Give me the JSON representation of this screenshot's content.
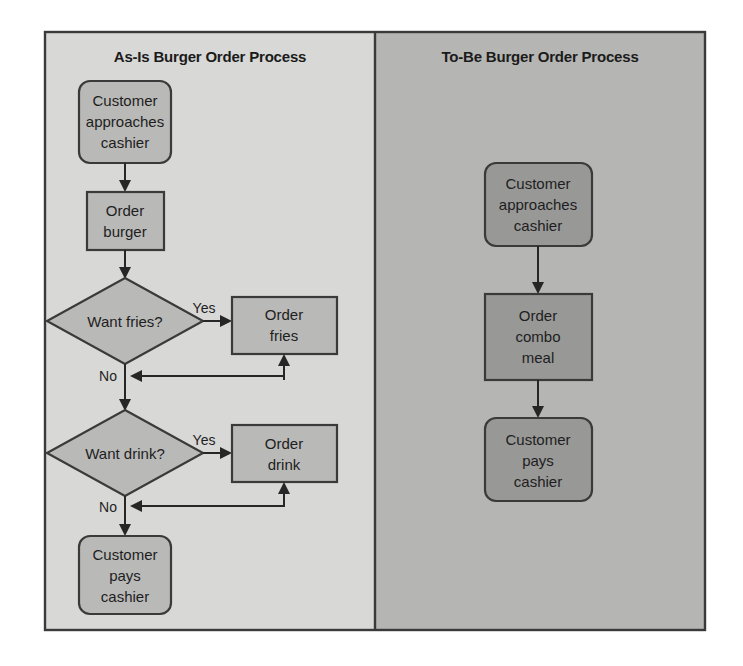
{
  "figure": {
    "background_color": "#ffffff",
    "frame_border_color": "#3a3a3a"
  },
  "panels": [
    {
      "id": "as-is",
      "title": "As-Is Burger Order Process",
      "background_color": "#d8d8d6",
      "node_fill": "#b9b9b7",
      "nodes": [
        {
          "id": "as-start",
          "type": "terminator",
          "label_lines": [
            "Customer",
            "approaches",
            "cashier"
          ]
        },
        {
          "id": "as-burger",
          "type": "process",
          "label_lines": [
            "Order",
            "burger"
          ]
        },
        {
          "id": "as-fries-q",
          "type": "decision",
          "label_lines": [
            "Want fries?"
          ]
        },
        {
          "id": "as-fries",
          "type": "process",
          "label_lines": [
            "Order",
            "fries"
          ]
        },
        {
          "id": "as-drink-q",
          "type": "decision",
          "label_lines": [
            "Want drink?"
          ]
        },
        {
          "id": "as-drink",
          "type": "process",
          "label_lines": [
            "Order",
            "drink"
          ]
        },
        {
          "id": "as-pays",
          "type": "terminator",
          "label_lines": [
            "Customer",
            "pays",
            "cashier"
          ]
        }
      ],
      "edge_labels": [
        {
          "id": "fries-yes",
          "text": "Yes"
        },
        {
          "id": "fries-no",
          "text": "No"
        },
        {
          "id": "drink-yes",
          "text": "Yes"
        },
        {
          "id": "drink-no",
          "text": "No"
        }
      ]
    },
    {
      "id": "to-be",
      "title": "To-Be Burger Order Process",
      "background_color": "#b5b5b3",
      "node_fill": "#989897",
      "nodes": [
        {
          "id": "tb-start",
          "type": "terminator",
          "label_lines": [
            "Customer",
            "approaches",
            "cashier"
          ]
        },
        {
          "id": "tb-combo",
          "type": "process",
          "label_lines": [
            "Order",
            "combo",
            "meal"
          ]
        },
        {
          "id": "tb-pays",
          "type": "terminator",
          "label_lines": [
            "Customer",
            "pays",
            "cashier"
          ]
        }
      ],
      "edge_labels": []
    }
  ],
  "text": {
    "as_is_title": "As-Is Burger Order Process",
    "to_be_title": "To-Be Burger Order Process",
    "as_start_l1": "Customer",
    "as_start_l2": "approaches",
    "as_start_l3": "cashier",
    "as_burger_l1": "Order",
    "as_burger_l2": "burger",
    "as_fries_q": "Want fries?",
    "as_fries_l1": "Order",
    "as_fries_l2": "fries",
    "as_drink_q": "Want drink?",
    "as_drink_l1": "Order",
    "as_drink_l2": "drink",
    "as_pays_l1": "Customer",
    "as_pays_l2": "pays",
    "as_pays_l3": "cashier",
    "yes_fries": "Yes",
    "no_fries": "No",
    "yes_drink": "Yes",
    "no_drink": "No",
    "tb_start_l1": "Customer",
    "tb_start_l2": "approaches",
    "tb_start_l3": "cashier",
    "tb_combo_l1": "Order",
    "tb_combo_l2": "combo",
    "tb_combo_l3": "meal",
    "tb_pays_l1": "Customer",
    "tb_pays_l2": "pays",
    "tb_pays_l3": "cashier"
  }
}
